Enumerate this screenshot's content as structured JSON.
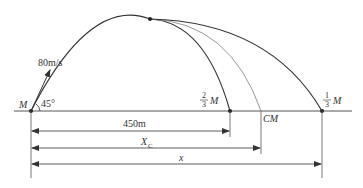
{
  "diagram": {
    "colors": {
      "main_line": "#333333",
      "cm_curve": "#9a9a9a",
      "background": "#ffffff"
    },
    "launch": {
      "label": "M",
      "angle_label": "45°",
      "velocity_label": "80m/s"
    },
    "landing_points": [
      {
        "id": "two-thirds",
        "label_num": "2",
        "label_den": "3",
        "label_var": "M"
      },
      {
        "id": "cm",
        "label": "CM"
      },
      {
        "id": "one-third",
        "label_num": "1",
        "label_den": "3",
        "label_var": "M"
      }
    ],
    "dimensions": [
      {
        "id": "d450",
        "label": "450m"
      },
      {
        "id": "dxc",
        "label": "X",
        "subscript": "C"
      },
      {
        "id": "dx",
        "label": "x"
      }
    ]
  }
}
